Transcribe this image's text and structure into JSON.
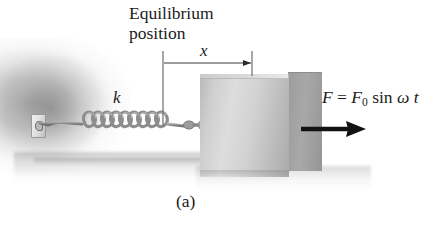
{
  "figure": {
    "caption": "(a)",
    "labels": {
      "equilibrium_line1": "Equilibrium",
      "equilibrium_line2": "position",
      "displacement": "x",
      "spring_constant": "k",
      "force_F": "F",
      "force_equals": "=",
      "force_F0": "F",
      "force_F0_sub": "0",
      "force_sin": "sin",
      "force_omega": "ω",
      "force_t": "t"
    },
    "annotations": {
      "force_equation_full": "F = F0 sin ω t",
      "equilibrium_full": "Equilibrium position"
    },
    "colors": {
      "ink": "#1b1b1b",
      "block_front": "#d2d2d2",
      "block_side": "#9e9e9e",
      "spring_metal": "#8f8f8f",
      "wall_gray": "#8a8a8a",
      "arrow_black": "#111111",
      "background": "#ffffff"
    },
    "elements": {
      "wall": "wall-support",
      "anchor": "spring-anchor-bracket",
      "spring": "coil-spring",
      "coil_count": 9,
      "block": "mass-block-cube",
      "dimension": "displacement-dimension-arrow",
      "force": "driving-force-arrow",
      "ground": "ground-shadow"
    }
  }
}
